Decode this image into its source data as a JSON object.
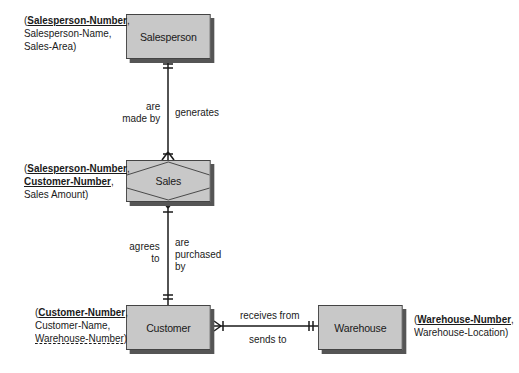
{
  "diagram": {
    "type": "entity-relationship",
    "entities": [
      {
        "id": "salesperson",
        "name": "Salesperson",
        "kind": "entity",
        "attributes": [
          {
            "text": "Salesperson-Number",
            "key": "primary"
          },
          {
            "text": "Salesperson-Name",
            "key": "none"
          },
          {
            "text": "Sales-Area",
            "key": "none"
          }
        ]
      },
      {
        "id": "sales",
        "name": "Sales",
        "kind": "associative-entity",
        "attributes": [
          {
            "text": "Salesperson-Number",
            "key": "primary"
          },
          {
            "text": "Customer-Number",
            "key": "primary"
          },
          {
            "text": "Sales Amount",
            "key": "none"
          }
        ]
      },
      {
        "id": "customer",
        "name": "Customer",
        "kind": "entity",
        "attributes": [
          {
            "text": "Customer-Number",
            "key": "primary"
          },
          {
            "text": "Customer-Name",
            "key": "none"
          },
          {
            "text": "Warehouse-Number",
            "key": "foreign"
          }
        ]
      },
      {
        "id": "warehouse",
        "name": "Warehouse",
        "kind": "entity",
        "attributes": [
          {
            "text": "Warehouse-Number",
            "key": "primary"
          },
          {
            "text": "Warehouse-Location",
            "key": "none"
          }
        ]
      }
    ],
    "relationships": [
      {
        "from": "salesperson",
        "to": "sales",
        "left_label": [
          "are",
          "made by"
        ],
        "right_label": [
          "generates"
        ],
        "from_cardinality": "one-and-only-one",
        "to_cardinality": "one-or-many"
      },
      {
        "from": "sales",
        "to": "customer",
        "left_label": [
          "agrees",
          "to"
        ],
        "right_label": [
          "are",
          "purchased",
          "by"
        ],
        "from_cardinality": "one-or-many",
        "to_cardinality": "one-and-only-one"
      },
      {
        "from": "customer",
        "to": "warehouse",
        "top_label": [
          "receives from"
        ],
        "bottom_label": [
          "sends to"
        ],
        "from_cardinality": "one-or-many",
        "to_cardinality": "one-and-only-one"
      }
    ]
  },
  "text": {
    "open_paren": "(",
    "comma": ",",
    "close_paren": ")"
  },
  "colors": {
    "entity_fill": "#c8c8c8",
    "entity_border": "#444444",
    "shadow": "#555555",
    "line": "#1a1a1a"
  }
}
